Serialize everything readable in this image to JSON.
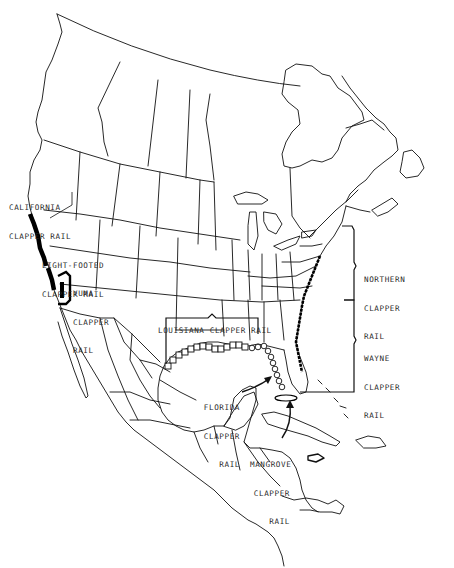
{
  "map": {
    "subject": "Clapper rail subspecies ranges in North America",
    "colors": {
      "background": "#ffffff",
      "linework": "#111111",
      "range_fill": "#000000",
      "label_text": "#2a2a2a"
    },
    "labels": {
      "california": {
        "line1": "CALIFORNIA",
        "line2": "CLAPPER RAIL"
      },
      "light_footed": {
        "line1": "LIGHT-FOOTED",
        "line2": "CLAPPER RAIL"
      },
      "yuma": {
        "line1": "YUMA",
        "line2": "CLAPPER",
        "line3": "RAIL"
      },
      "louisiana": {
        "line1": "LOUISIANA CLAPPER RAIL"
      },
      "northern": {
        "line1": "NORTHERN",
        "line2": "CLAPPER",
        "line3": "RAIL"
      },
      "wayne": {
        "line1": "WAYNE",
        "line2": "CLAPPER",
        "line3": "RAIL"
      },
      "florida": {
        "line1": "FLORIDA",
        "line2": "CLAPPER",
        "line3": "RAIL"
      },
      "mangrove": {
        "line1": "MANGROVE",
        "line2": "CLAPPER",
        "line3": "RAIL"
      }
    },
    "range_markers": {
      "california": "solid-black-coastline",
      "light_footed": "solid-black-coastline",
      "yuma": "solid-black-bracket",
      "louisiana": "open-squares",
      "florida": "open-circles",
      "northern": "heavy-coastline-bracket",
      "wayne": "heavy-coastline-bracket",
      "mangrove": "ellipse"
    }
  }
}
